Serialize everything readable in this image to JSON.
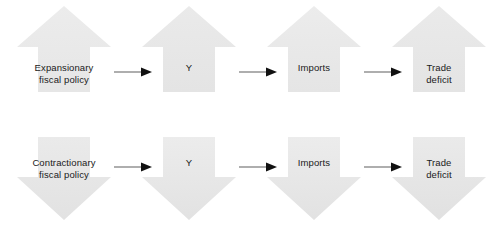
{
  "diagram": {
    "colors": {
      "arrow_fill_top": "#e9e9e9",
      "arrow_fill_bottom": "#e4e4e4",
      "connector_line": "#8c8c8c",
      "connector_head": "#111111",
      "label_text": "#1a1a1a",
      "background": "#ffffff"
    },
    "rows": [
      {
        "id": "expansionary-row",
        "direction": "up",
        "direction_icon": "arrow-up-block-icon",
        "steps": [
          {
            "id": "expansionary-fiscal-policy",
            "label": "Expansionary\nfiscal policy",
            "wide": true
          },
          {
            "id": "output-y",
            "label": "Y",
            "wide": false
          },
          {
            "id": "imports",
            "label": "Imports",
            "wide": false
          },
          {
            "id": "trade-deficit",
            "label": "Trade\ndeficit",
            "wide": false
          }
        ],
        "connectors": [
          {
            "id": "connector-1",
            "icon": "arrow-right-icon"
          },
          {
            "id": "connector-2",
            "icon": "arrow-right-icon"
          },
          {
            "id": "connector-3",
            "icon": "arrow-right-icon"
          }
        ]
      },
      {
        "id": "contractionary-row",
        "direction": "down",
        "direction_icon": "arrow-down-block-icon",
        "steps": [
          {
            "id": "contractionary-fiscal-policy",
            "label": "Contractionary\nfiscal policy",
            "wide": true
          },
          {
            "id": "output-y",
            "label": "Y",
            "wide": false
          },
          {
            "id": "imports",
            "label": "Imports",
            "wide": false
          },
          {
            "id": "trade-deficit",
            "label": "Trade\ndeficit",
            "wide": false
          }
        ],
        "connectors": [
          {
            "id": "connector-1",
            "icon": "arrow-right-icon"
          },
          {
            "id": "connector-2",
            "icon": "arrow-right-icon"
          },
          {
            "id": "connector-3",
            "icon": "arrow-right-icon"
          }
        ]
      }
    ]
  }
}
